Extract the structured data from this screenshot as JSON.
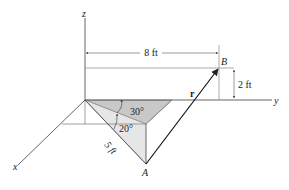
{
  "figure": {
    "type": "3D position vector diagram",
    "colors": {
      "line": "#333333",
      "axis": "#555555",
      "shade_dark": "#c8c8c8",
      "shade_light": "#e6e6e6",
      "background": "#ffffff"
    },
    "axes": {
      "x_label": "x",
      "y_label": "y",
      "z_label": "z"
    },
    "points": {
      "A_label": "A",
      "B_label": "B"
    },
    "vector": {
      "label": "r"
    },
    "dimensions": {
      "horizontal_dim": "8 ft",
      "vertical_dim": "2 ft",
      "slant_dim": "5 ft"
    },
    "angles": {
      "angle1": "30°",
      "angle2": "20°"
    }
  }
}
